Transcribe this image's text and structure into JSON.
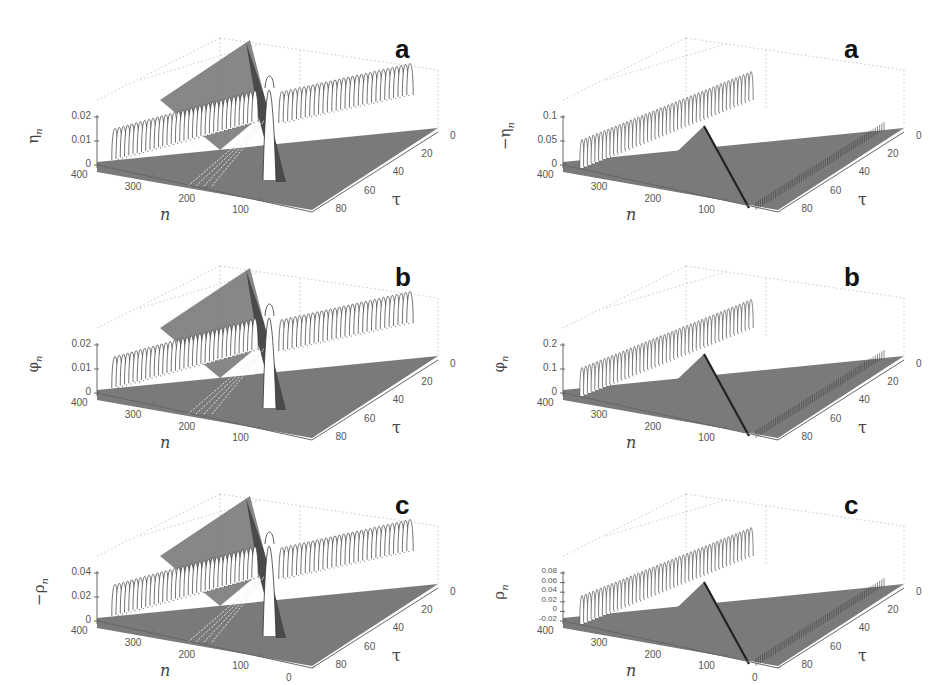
{
  "chart_data": [
    {
      "id": "left-a",
      "panel_letter": "a",
      "type": "surface-waterfall",
      "title": "",
      "zlabel": "η_n",
      "xlabel": "n",
      "ylabel": "τ",
      "ylabel_text": "η",
      "ylabel_sub": "n",
      "z_ticks": [
        "0.02",
        "0.01",
        "0"
      ],
      "zlim": [
        0,
        0.02
      ],
      "n_ticks": [
        "400",
        "300",
        "200",
        "100"
      ],
      "n_range": [
        0,
        400
      ],
      "tau_ticks": [
        "0",
        "20",
        "40",
        "60",
        "80"
      ],
      "tau_range": [
        0,
        90
      ],
      "description": "Two counter-propagating pulse trains from collision near n≈200; tall central spike at collision point",
      "peak_amplitude": 0.02,
      "style": "positive"
    },
    {
      "id": "right-a",
      "panel_letter": "a",
      "type": "surface-waterfall",
      "title": "",
      "zlabel": "-η_n",
      "xlabel": "n",
      "ylabel": "τ",
      "ylabel_text": "−η",
      "ylabel_sub": "n",
      "z_ticks": [
        "0.1",
        "0.05",
        "0"
      ],
      "zlim": [
        0,
        0.1
      ],
      "n_ticks": [
        "400",
        "300",
        "200",
        "100"
      ],
      "n_range": [
        0,
        400
      ],
      "tau_ticks": [
        "0",
        "20",
        "40",
        "60",
        "80"
      ],
      "tau_range": [
        0,
        90
      ],
      "description": "Pulse train propagating from n≈0 toward n≈400 with triangular wake",
      "peak_amplitude": 0.1,
      "style": "dense"
    },
    {
      "id": "left-b",
      "panel_letter": "b",
      "type": "surface-waterfall",
      "title": "",
      "zlabel": "φ_n",
      "xlabel": "n",
      "ylabel": "τ",
      "ylabel_text": "φ",
      "ylabel_sub": "n",
      "z_ticks": [
        "0.02",
        "0.01",
        "0"
      ],
      "zlim": [
        0,
        0.02
      ],
      "n_ticks": [
        "400",
        "300",
        "200",
        "100"
      ],
      "n_range": [
        0,
        400
      ],
      "tau_ticks": [
        "0",
        "20",
        "40",
        "60",
        "80"
      ],
      "tau_range": [
        0,
        90
      ],
      "description": "Two counter-propagating pulse trains with central spike",
      "peak_amplitude": 0.02,
      "style": "positive"
    },
    {
      "id": "right-b",
      "panel_letter": "b",
      "type": "surface-waterfall",
      "title": "",
      "zlabel": "φ_n",
      "xlabel": "n",
      "ylabel": "τ",
      "ylabel_text": "φ",
      "ylabel_sub": "n",
      "z_ticks": [
        "0.2",
        "0.1",
        "0"
      ],
      "zlim": [
        0,
        0.2
      ],
      "n_ticks": [
        "400",
        "300",
        "200",
        "100"
      ],
      "n_range": [
        0,
        400
      ],
      "tau_ticks": [
        "0",
        "20",
        "40",
        "60",
        "80"
      ],
      "tau_range": [
        0,
        90
      ],
      "description": "Pulse train propagating across lattice with triangular wake",
      "peak_amplitude": 0.2,
      "style": "dense"
    },
    {
      "id": "left-c",
      "panel_letter": "c",
      "type": "surface-waterfall",
      "title": "",
      "zlabel": "-ρ_n",
      "xlabel": "n",
      "ylabel": "τ",
      "ylabel_text": "−ρ",
      "ylabel_sub": "n",
      "z_ticks": [
        "0.04",
        "0.02",
        "0"
      ],
      "zlim": [
        0,
        0.04
      ],
      "n_ticks": [
        "400",
        "300",
        "200",
        "100",
        "0"
      ],
      "n_range": [
        0,
        400
      ],
      "tau_ticks": [
        "0",
        "20",
        "40",
        "60",
        "80"
      ],
      "tau_range": [
        0,
        90
      ],
      "description": "Two counter-propagating pulse trains with central spike",
      "peak_amplitude": 0.04,
      "style": "positive"
    },
    {
      "id": "right-c",
      "panel_letter": "c",
      "type": "surface-waterfall",
      "title": "",
      "zlabel": "ρ_n",
      "xlabel": "n",
      "ylabel": "τ",
      "ylabel_text": "ρ",
      "ylabel_sub": "n",
      "z_ticks": [
        "0.08",
        "0.06",
        "0.04",
        "0.02",
        "0",
        "-0.02"
      ],
      "zlim": [
        -0.02,
        0.08
      ],
      "n_ticks": [
        "400",
        "300",
        "200",
        "100",
        "0"
      ],
      "n_range": [
        0,
        400
      ],
      "tau_ticks": [
        "0",
        "20",
        "40",
        "60",
        "80"
      ],
      "tau_range": [
        0,
        90
      ],
      "description": "Pulse train with triangular wake; right edge shows oscillating boundary",
      "peak_amplitude": 0.08,
      "style": "dense"
    }
  ],
  "layout": {
    "panels": [
      {
        "key": 0,
        "left": 0,
        "top": 0
      },
      {
        "key": 1,
        "left": 466,
        "top": 0
      },
      {
        "key": 2,
        "left": 0,
        "top": 228
      },
      {
        "key": 3,
        "left": 466,
        "top": 228
      },
      {
        "key": 4,
        "left": 0,
        "top": 456
      },
      {
        "key": 5,
        "left": 466,
        "top": 456
      }
    ]
  },
  "colors": {
    "surface": "#7a7a7a",
    "surface_dark": "#4a4a4a",
    "ridge_fill": "#ffffff",
    "ridge_stroke": "#333333",
    "grid": "#bdbdbd",
    "axis": "#666666"
  }
}
